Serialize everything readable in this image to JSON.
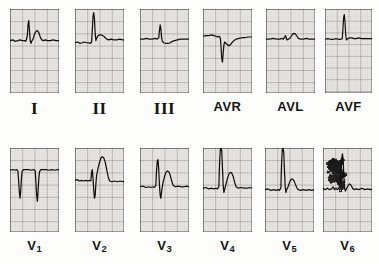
{
  "document": {
    "kind": "12-lead electrocardiogram tracing",
    "background_color": "#fdfdfc",
    "paper_color": "#eceae6",
    "grid_minor_color": "#8b8a86",
    "grid_major_color": "#4a4a48",
    "trace_color": "#101010"
  },
  "rows": [
    {
      "name": "limb-and-augmented-leads",
      "leads": [
        {
          "id": "I",
          "label": "I",
          "label_style": "roman",
          "panel": {
            "x": 10,
            "y": 9,
            "w": 49,
            "h": 84
          },
          "baseline_pct": 52,
          "description": "small r with upright R spike and broad T wave, isoelectric baseline",
          "morphology": {
            "r_amplitude": "moderate",
            "t_wave": "upright",
            "q_wave": "small"
          },
          "trace": "M0,44 L4,43 L7,45 L11,44 L14,43 L17,44 L20,44 L22,45 L24,38 L25,22 L26,16 L27,30 L28,44 L29,48 L30,45 L32,42 L34,35 L36,31 L38,30 L40,33 L42,39 L44,43 L47,44 L49,43 L52,44 L56,44 L60,43 L64,44 L68,44"
        },
        {
          "id": "II",
          "label": "II",
          "label_style": "roman",
          "panel": {
            "x": 75,
            "y": 9,
            "w": 49,
            "h": 84
          },
          "baseline_pct": 55,
          "description": "tall narrow R wave, small S, flat ST, low T wave",
          "morphology": {
            "r_amplitude": "tall",
            "t_wave": "low upright",
            "q_wave": "none"
          },
          "trace": "M0,47 L4,46 L7,48 L10,47 L13,46 L16,47 L19,47 L21,48 L23,46 L24,30 L25,10 L26,5 L27,14 L28,34 L29,44 L30,41 L32,37 L34,36 L36,36 L38,37 L40,38 L42,40 L44,42 L47,43 L50,42 L54,43 L58,43 L62,42 L66,43 L68,43"
        },
        {
          "id": "III",
          "label": "III",
          "label_style": "roman",
          "panel": {
            "x": 140,
            "y": 9,
            "w": 49,
            "h": 84
          },
          "baseline_pct": 50,
          "description": "small narrow R spike, shallow inverted/flat T wave",
          "morphology": {
            "r_amplitude": "small",
            "t_wave": "shallow inverted",
            "q_wave": "none"
          },
          "trace": "M0,42 L5,42 L9,41 L13,42 L17,42 L21,41 L24,42 L26,40 L27,30 L28,22 L29,28 L30,40 L31,45 L33,47 L36,48 L39,48 L42,47 L45,45 L48,44 L52,43 L56,42 L60,42 L64,42 L68,42"
        },
        {
          "id": "AVR",
          "label": "AVR",
          "label_style": "sans",
          "panel": {
            "x": 203,
            "y": 9,
            "w": 49,
            "h": 84
          },
          "baseline_pct": 45,
          "description": "deep negative QS complex, inverted T wave",
          "morphology": {
            "r_amplitude": "none",
            "t_wave": "inverted",
            "q_wave": "deep QS"
          },
          "trace": "M0,38 L4,37 L8,37 L12,36 L15,37 L18,38 L20,39 L22,38 L24,40 L25,52 L26,68 L27,74 L28,62 L29,50 L30,46 L32,48 L34,50 L36,51 L38,50 L40,47 L43,44 L46,42 L50,41 L54,40 L58,40 L62,39 L66,39 L68,39"
        },
        {
          "id": "AVL",
          "label": "AVL",
          "label_style": "sans",
          "panel": {
            "x": 266,
            "y": 9,
            "w": 49,
            "h": 84
          },
          "baseline_pct": 50,
          "description": "very low voltage complex, tiny r, small rounded T wave",
          "morphology": {
            "r_amplitude": "very small",
            "t_wave": "small upright",
            "q_wave": "none"
          },
          "trace": "M0,42 L5,42 L10,41 L15,42 L19,42 L22,41 L24,42 L26,39 L27,37 L28,40 L29,43 L31,42 L33,41 L35,38 L37,35 L39,34 L41,35 L43,38 L45,41 L48,42 L52,42 L56,41 L60,42 L64,42 L68,42"
        },
        {
          "id": "AVF",
          "label": "AVF",
          "label_style": "sans",
          "panel": {
            "x": 325,
            "y": 9,
            "w": 47,
            "h": 84
          },
          "baseline_pct": 52,
          "description": "tall narrow R spike, flat baseline, minimal T wave",
          "morphology": {
            "r_amplitude": "tall narrow",
            "t_wave": "flat",
            "q_wave": "none"
          },
          "trace": "M0,44 L4,43 L8,44 L12,44 L16,43 L20,44 L23,44 L25,43 L26,28 L27,12 L28,8 L29,20 L30,38 L31,45 L33,43 L36,42 L39,42 L42,43 L45,43 L49,42 L53,43 L57,43 L61,43 L65,43 L68,43"
        }
      ]
    },
    {
      "name": "precordial-leads",
      "leads": [
        {
          "id": "V1",
          "label": "V",
          "subscript": "1",
          "label_style": "sans",
          "panel": {
            "x": 10,
            "y": 148,
            "w": 49,
            "h": 84
          },
          "baseline_pct": 38,
          "description": "deep QS complexes, two beats, no R wave progression",
          "morphology": {
            "r_amplitude": "none",
            "t_wave": "flat",
            "q_wave": "deep QS"
          },
          "trace": "M0,31 L4,30 L7,31 L9,30 L11,32 L12,46 L13,62 L14,70 L15,58 L16,40 L17,32 L19,30 L22,30 L26,30 L30,31 L33,30 L35,32 L36,48 L37,66 L38,74 L39,60 L40,42 L41,33 L43,30 L46,30 L50,30 L54,31 L58,30 L62,31 L66,30 L68,31"
        },
        {
          "id": "V2",
          "label": "V",
          "subscript": "2",
          "label_style": "sans",
          "panel": {
            "x": 75,
            "y": 148,
            "w": 49,
            "h": 84
          },
          "baseline_pct": 52,
          "description": "small r, deep S wave, large broad upright T wave",
          "morphology": {
            "r_amplitude": "small r",
            "t_wave": "tall upright",
            "q_wave": "none",
            "s_wave": "deep"
          },
          "trace": "M0,45 L3,44 L6,46 L9,45 L12,46 L15,45 L18,46 L20,45 L22,46 L23,34 L24,30 L25,42 L26,58 L27,70 L28,66 L29,50 L30,38 L32,28 L34,20 L36,14 L38,12 L40,14 L42,20 L44,30 L46,40 L48,46 L51,47 L55,46 L59,47 L63,46 L67,47 L68,46"
        },
        {
          "id": "V3",
          "label": "V",
          "subscript": "3",
          "label_style": "sans",
          "panel": {
            "x": 140,
            "y": 148,
            "w": 49,
            "h": 84
          },
          "baseline_pct": 60,
          "description": "tall R wave, deep S wave, broad upright T wave",
          "morphology": {
            "r_amplitude": "tall",
            "t_wave": "upright broad",
            "q_wave": "none",
            "s_wave": "deep"
          },
          "trace": "M0,54 L4,53 L8,55 L12,54 L15,55 L18,54 L20,55 L22,52 L23,30 L24,18 L25,16 L26,30 L27,52 L28,66 L29,70 L30,60 L32,48 L34,40 L36,34 L38,32 L40,33 L42,38 L44,46 L46,52 L49,54 L53,53 L57,54 L61,54 L65,53 L68,54"
        },
        {
          "id": "V4",
          "label": "V",
          "subscript": "4",
          "label_style": "sans",
          "panel": {
            "x": 203,
            "y": 148,
            "w": 49,
            "h": 84
          },
          "baseline_pct": 62,
          "description": "very tall R wave clipped at panel top, upright T wave",
          "morphology": {
            "r_amplitude": "very tall (clipped)",
            "t_wave": "upright",
            "q_wave": "none"
          },
          "trace": "M0,56 L4,55 L8,57 L12,56 L15,57 L18,56 L20,57 L22,54 L23,20 L24,2 L25,0 L26,4 L27,28 L28,52 L29,62 L30,58 L32,50 L34,42 L36,36 L38,34 L40,35 L42,40 L44,48 L46,54 L49,56 L53,55 L57,56 L61,56 L65,55 L68,56"
        },
        {
          "id": "V5",
          "label": "V",
          "subscript": "5",
          "label_style": "sans",
          "panel": {
            "x": 265,
            "y": 148,
            "w": 49,
            "h": 84
          },
          "baseline_pct": 64,
          "description": "tall R wave clipped at top, small notched T wave",
          "morphology": {
            "r_amplitude": "tall (clipped)",
            "t_wave": "small upright notched",
            "q_wave": "none"
          },
          "trace": "M0,58 L4,57 L8,59 L12,58 L15,59 L18,58 L20,59 L22,56 L23,22 L24,2 L25,0 L26,6 L27,32 L28,54 L29,62 L30,58 L32,54 L34,48 L36,44 L38,43 L40,45 L42,50 L44,55 L46,58 L49,59 L53,58 L57,59 L61,58 L65,59 L68,58"
        },
        {
          "id": "V6",
          "label": "V",
          "subscript": "6",
          "label_style": "sans",
          "panel": {
            "x": 323,
            "y": 148,
            "w": 49,
            "h": 84
          },
          "baseline_pct": 62,
          "description": "heavy dark ink artifact over left half of panel, tall R spike, wandering baseline",
          "morphology": {
            "r_amplitude": "tall",
            "t_wave": "obscured by artifact",
            "artifact": "large ink blot"
          },
          "trace": "M0,56 L3,58 L6,56 L9,58 L12,57 L14,54 L16,58 L18,56 L20,58 L22,56 L24,50 L25,30 L26,14 L27,8 L28,18 L29,40 L30,56 L31,60 L33,56 L35,52 L37,50 L39,52 L41,56 L43,58 L46,57 L50,58 L54,56 L58,58 L62,57 L66,58 L68,57",
          "artifact_blot": true
        }
      ]
    }
  ]
}
